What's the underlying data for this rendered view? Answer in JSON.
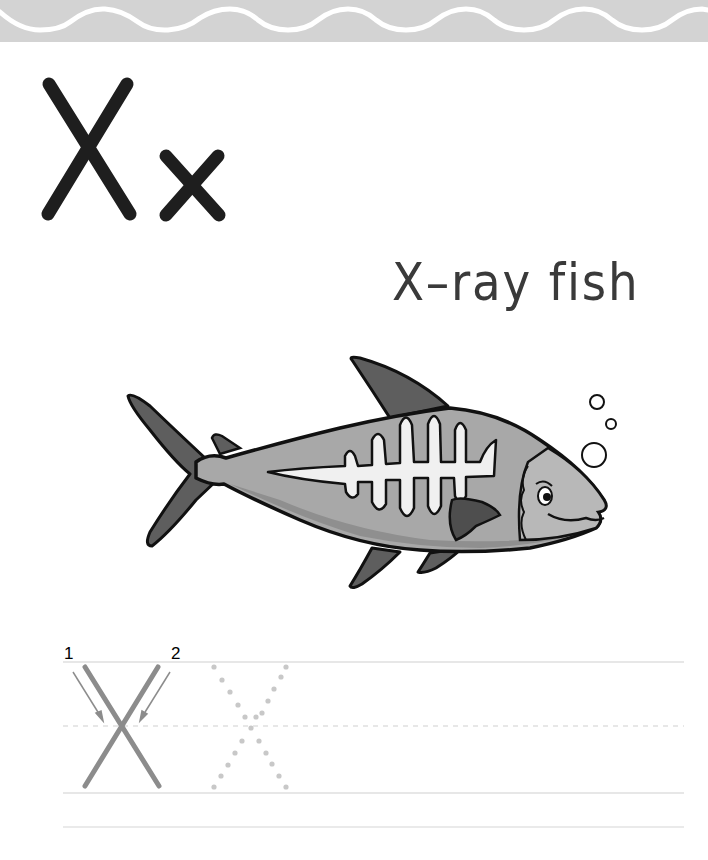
{
  "banner": {
    "style": "wavy-border",
    "color": "#d2d2d2",
    "wave_color": "#ffffff"
  },
  "letters": {
    "uppercase": "X",
    "lowercase": "x",
    "color": "#1e1e1e"
  },
  "word": {
    "text": "X–ray fish"
  },
  "illustration": {
    "subject": "x-ray-fish",
    "bubbles": 3,
    "colors": {
      "body": "#a8a8a8",
      "fin": "#5e5e5e",
      "bones": "#f0f0f0",
      "outline": "#111111"
    }
  },
  "practice": {
    "stroke_labels": [
      "1",
      "2"
    ],
    "guide_letter": "X",
    "trace_letter": "X",
    "stroke_color": "#8c8c8c",
    "dot_color": "#c8c8c8",
    "line_color": "#cfcfcf"
  }
}
